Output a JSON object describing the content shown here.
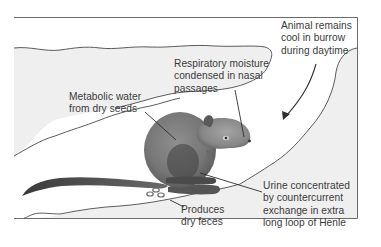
{
  "figure": {
    "type": "burrow cross-section illustration",
    "colors": {
      "frame": "#6b6b6b",
      "tunnel_fill": "#efefef",
      "outline": "#4a4a4a",
      "rodent_body": "#7a7a7a",
      "rodent_dark": "#4c4c4c",
      "text": "#3a3a3a"
    }
  },
  "labels": {
    "respiratory": {
      "lines": [
        "Respiratory moisture",
        "condensed in nasal",
        "passages"
      ]
    },
    "burrow": {
      "lines": [
        "Animal remains",
        "cool in burrow",
        "during daytime"
      ]
    },
    "metabolic": {
      "lines": [
        "Metabolic water",
        "from dry seeds"
      ]
    },
    "urine": {
      "lines": [
        "Urine concentrated",
        "by countercurrent",
        "exchange in extra",
        "long loop of Henle"
      ]
    },
    "feces": {
      "lines": [
        "Produces",
        "dry feces"
      ]
    }
  }
}
